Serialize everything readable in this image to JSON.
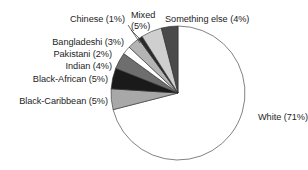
{
  "chart_data": {
    "type": "pie",
    "title": "",
    "subtitle": "",
    "xlabel": "",
    "ylabel": "",
    "legend_position": "none",
    "grid": false,
    "unit": "%",
    "start_angle_deg": 0,
    "direction": "clockwise",
    "categories": [
      "White",
      "Black-Caribbean",
      "Black-African",
      "Indian",
      "Pakistani",
      "Bangladeshi",
      "Chinese",
      "Mixed",
      "Something else"
    ],
    "values": [
      71,
      5,
      5,
      4,
      2,
      3,
      1,
      5,
      4
    ],
    "slices": [
      {
        "name": "White",
        "value": 71,
        "label": "White (71%)",
        "color": "#ffffff",
        "label_x": 258,
        "label_y": 120,
        "label_anchor": "start",
        "leader": false
      },
      {
        "name": "Black-Caribbean",
        "value": 5,
        "label": "Black-Caribbean (5%)",
        "color": "#a8a8a8",
        "label_x": 108,
        "label_y": 104,
        "label_anchor": "end",
        "leader": false
      },
      {
        "name": "Black-African",
        "value": 5,
        "label": "Black-African (5%)",
        "color": "#1a1a1a",
        "label_x": 108,
        "label_y": 82,
        "label_anchor": "end",
        "leader": false
      },
      {
        "name": "Indian",
        "value": 4,
        "label": "Indian (4%)",
        "color": "#6e6e6e",
        "label_x": 112,
        "label_y": 69,
        "label_anchor": "end",
        "leader": false
      },
      {
        "name": "Pakistani",
        "value": 2,
        "label": "Pakistani (2%)",
        "color": "#ffffff",
        "label_x": 112,
        "label_y": 57,
        "label_anchor": "end",
        "leader": false
      },
      {
        "name": "Bangladeshi",
        "value": 3,
        "label": "Bangladeshi (3%)",
        "color": "#b4b4b4",
        "label_x": 124,
        "label_y": 45,
        "label_anchor": "end",
        "leader": false
      },
      {
        "name": "Chinese",
        "value": 1,
        "label": "Chinese (1%)",
        "color": "#2a2a2a",
        "label_x": 125,
        "label_y": 22,
        "label_anchor": "end",
        "leader": true
      },
      {
        "name": "Mixed",
        "value": 5,
        "label": "Mixed",
        "label_line2": "(5%)",
        "color": "#cfcfcf",
        "label_x": 131,
        "label_y": 18,
        "label_anchor": "start",
        "leader": true
      },
      {
        "name": "Something else",
        "value": 4,
        "label": "Something else (4%)",
        "color": "#4a4a4a",
        "label_x": 165,
        "label_y": 22,
        "label_anchor": "start",
        "leader": false
      }
    ],
    "geometry": {
      "center_x": 178,
      "center_y": 93,
      "radius": 67
    },
    "colors": {
      "outline": "#2e2e2e",
      "text": "#1d1d1d",
      "background": "#ffffff"
    }
  }
}
